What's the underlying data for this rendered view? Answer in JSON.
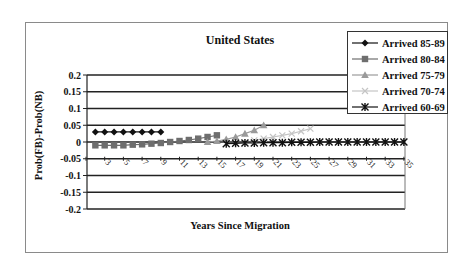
{
  "chart_data": {
    "type": "line",
    "title": "United States",
    "xlabel": "Years Since Migration",
    "ylabel": "Prob(FB)-Prob(NB)",
    "ylim": [
      -0.2,
      0.2
    ],
    "yticks": [
      0.2,
      0.15,
      0.1,
      0.05,
      0,
      -0.05,
      -0.1,
      -0.15,
      -0.2
    ],
    "ytick_labels": [
      "0.2",
      "0.15",
      "0.1",
      "0.05",
      "0",
      "-0.05",
      "-0.1",
      "-0.15",
      "-0.2"
    ],
    "x": [
      1,
      2,
      3,
      4,
      5,
      6,
      7,
      8,
      9,
      10,
      11,
      12,
      13,
      14,
      15,
      16,
      17,
      18,
      19,
      20,
      21,
      22,
      23,
      24,
      25,
      26,
      27,
      28,
      29,
      30,
      31,
      32,
      33,
      34,
      35
    ],
    "xtick_labels": [
      "1",
      "3",
      "5",
      "7",
      "9",
      "11",
      "13",
      "15",
      "17",
      "19",
      "21",
      "23",
      "25",
      "27",
      "29",
      "31",
      "33",
      "35"
    ],
    "grid": "horizontal",
    "legend_position": "top-right",
    "series": [
      {
        "name": "Arrived 85-89",
        "marker": "diamond",
        "color": "#111111",
        "x": [
          2,
          3,
          4,
          5,
          6,
          7,
          8,
          9
        ],
        "values": [
          0.03,
          0.03,
          0.03,
          0.03,
          0.03,
          0.03,
          0.03,
          0.03
        ]
      },
      {
        "name": "Arrived 80-84",
        "marker": "square",
        "color": "#6e6e6e",
        "x": [
          2,
          3,
          4,
          5,
          6,
          7,
          8,
          9,
          10,
          11,
          12,
          13,
          14,
          15
        ],
        "values": [
          -0.01,
          -0.01,
          -0.01,
          -0.01,
          -0.008,
          -0.007,
          -0.005,
          -0.003,
          0,
          0.003,
          0.006,
          0.01,
          0.015,
          0.02
        ]
      },
      {
        "name": "Arrived 75-79",
        "marker": "triangle",
        "color": "#9a9a9a",
        "x": [
          14,
          15,
          16,
          17,
          18,
          19,
          20
        ],
        "values": [
          0,
          0.003,
          0.008,
          0.015,
          0.025,
          0.035,
          0.05
        ]
      },
      {
        "name": "Arrived 70-74",
        "marker": "x",
        "color": "#c4c4c4",
        "x": [
          19,
          20,
          21,
          22,
          23,
          24,
          25
        ],
        "values": [
          0.005,
          0.01,
          0.015,
          0.02,
          0.025,
          0.032,
          0.04
        ]
      },
      {
        "name": "Arrived 60-69",
        "marker": "star",
        "color": "#111111",
        "x": [
          16,
          17,
          18,
          19,
          20,
          21,
          22,
          23,
          24,
          25,
          26,
          27,
          28,
          29,
          30,
          31,
          32,
          33,
          34,
          35
        ],
        "values": [
          -0.005,
          -0.004,
          -0.003,
          -0.003,
          -0.002,
          -0.002,
          -0.002,
          -0.001,
          -0.001,
          -0.001,
          0,
          0,
          0,
          0,
          0,
          0,
          0,
          0,
          0,
          0
        ]
      }
    ]
  }
}
